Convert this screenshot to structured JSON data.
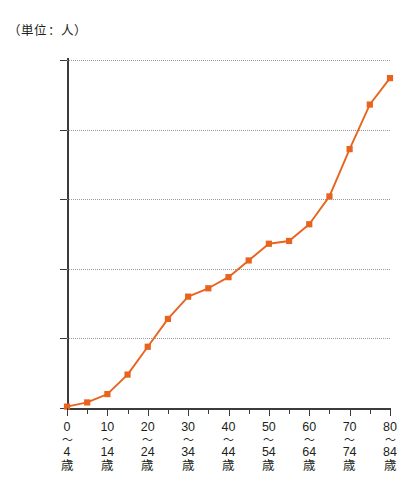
{
  "chart_data": {
    "type": "line",
    "title": "（単位：人）",
    "xlabel": "",
    "ylabel": "",
    "unit_caption": "（単位：人）",
    "series_color": "#E8641E",
    "grid": true,
    "legend": "none",
    "ylim": [
      0,
      250
    ],
    "yticks": [
      0,
      50,
      100,
      150,
      200,
      250
    ],
    "ytick_labels": [
      "0",
      "50",
      "100",
      "150",
      "200",
      "250"
    ],
    "xlim": [
      0,
      80
    ],
    "x": [
      0,
      5,
      10,
      15,
      20,
      25,
      30,
      35,
      40,
      45,
      50,
      55,
      60,
      65,
      70,
      75,
      80
    ],
    "values": [
      1,
      4,
      10,
      24,
      44,
      64,
      80,
      86,
      94,
      106,
      118,
      120,
      132,
      152,
      186,
      218,
      237
    ],
    "categories": [
      "0〜4歳",
      "5〜9歳",
      "10〜14歳",
      "15〜19歳",
      "20〜24歳",
      "25〜29歳",
      "30〜34歳",
      "35〜39歳",
      "40〜44歳",
      "45〜49歳",
      "50〜54歳",
      "55〜59歳",
      "60〜64歳",
      "65〜69歳",
      "70〜74歳",
      "75〜79歳",
      "80〜84歳"
    ],
    "xtick_labels": [
      {
        "lo": "0",
        "tilde": "〜",
        "hi": "4",
        "sai": "歳",
        "shown": true
      },
      {
        "lo": "5",
        "tilde": "〜",
        "hi": "9",
        "sai": "歳",
        "shown": false
      },
      {
        "lo": "10",
        "tilde": "〜",
        "hi": "14",
        "sai": "歳",
        "shown": true
      },
      {
        "lo": "15",
        "tilde": "〜",
        "hi": "19",
        "sai": "歳",
        "shown": false
      },
      {
        "lo": "20",
        "tilde": "〜",
        "hi": "24",
        "sai": "歳",
        "shown": true
      },
      {
        "lo": "25",
        "tilde": "〜",
        "hi": "29",
        "sai": "歳",
        "shown": false
      },
      {
        "lo": "30",
        "tilde": "〜",
        "hi": "34",
        "sai": "歳",
        "shown": true
      },
      {
        "lo": "35",
        "tilde": "〜",
        "hi": "39",
        "sai": "歳",
        "shown": false
      },
      {
        "lo": "40",
        "tilde": "〜",
        "hi": "44",
        "sai": "歳",
        "shown": true
      },
      {
        "lo": "45",
        "tilde": "〜",
        "hi": "49",
        "sai": "歳",
        "shown": false
      },
      {
        "lo": "50",
        "tilde": "〜",
        "hi": "54",
        "sai": "歳",
        "shown": true
      },
      {
        "lo": "55",
        "tilde": "〜",
        "hi": "59",
        "sai": "歳",
        "shown": false
      },
      {
        "lo": "60",
        "tilde": "〜",
        "hi": "64",
        "sai": "歳",
        "shown": true
      },
      {
        "lo": "65",
        "tilde": "〜",
        "hi": "69",
        "sai": "歳",
        "shown": false
      },
      {
        "lo": "70",
        "tilde": "〜",
        "hi": "74",
        "sai": "歳",
        "shown": true
      },
      {
        "lo": "75",
        "tilde": "〜",
        "hi": "79",
        "sai": "歳",
        "shown": false
      },
      {
        "lo": "80",
        "tilde": "〜",
        "hi": "84",
        "sai": "歳",
        "shown": true
      }
    ]
  }
}
